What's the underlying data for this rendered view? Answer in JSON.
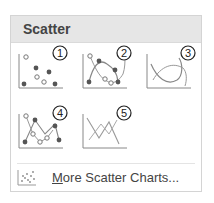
{
  "gallery": {
    "title": "Scatter",
    "items": [
      {
        "id": 1,
        "badge": "1",
        "name": "Scatter"
      },
      {
        "id": 2,
        "badge": "2",
        "name": "Scatter with Smooth Lines and Markers"
      },
      {
        "id": 3,
        "badge": "3",
        "name": "Scatter with Smooth Lines"
      },
      {
        "id": 4,
        "badge": "4",
        "name": "Scatter with Straight Lines and Markers"
      },
      {
        "id": 5,
        "badge": "5",
        "name": "Scatter with Straight Lines"
      }
    ],
    "more": {
      "label_accel": "M",
      "label_rest": "ore Scatter Charts..."
    }
  },
  "colors": {
    "header_bg": "#e6e6e6",
    "text": "#444444",
    "icon_stroke": "#888888",
    "marker_dark": "#555555"
  }
}
